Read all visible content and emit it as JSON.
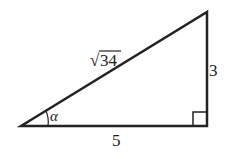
{
  "diagram": {
    "type": "right-triangle",
    "hypotenuse_label": "34",
    "hypotenuse_radical": "√",
    "opposite_label": "3",
    "adjacent_label": "5",
    "angle_label": "α",
    "right_angle_marker": true,
    "colors": {
      "stroke": "#222222",
      "background": "#ffffff"
    }
  }
}
